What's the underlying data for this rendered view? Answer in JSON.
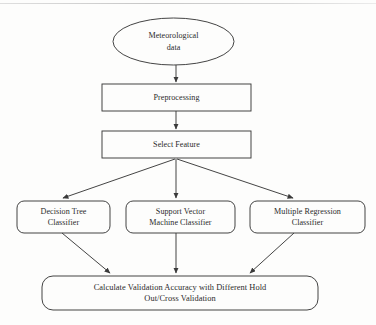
{
  "diagram": {
    "type": "flowchart",
    "background_color": "#fdfdfc",
    "stroke_color": "#3a3a3a",
    "text_color": "#2b2b2b",
    "nodes": [
      {
        "id": "source",
        "shape": "ellipse",
        "lines": [
          "Meteorological",
          "data"
        ]
      },
      {
        "id": "preprocess",
        "shape": "rectangle",
        "lines": [
          "Preprocessing"
        ]
      },
      {
        "id": "select",
        "shape": "rectangle",
        "lines": [
          "Select Feature"
        ]
      },
      {
        "id": "dtree",
        "shape": "rounded-rectangle",
        "lines": [
          "Decision Tree",
          "Classifier"
        ]
      },
      {
        "id": "svm",
        "shape": "rounded-rectangle",
        "lines": [
          "Support Vector",
          "Machine Classifier"
        ]
      },
      {
        "id": "mreg",
        "shape": "rounded-rectangle",
        "lines": [
          "Multiple Regression",
          "Classifier"
        ]
      },
      {
        "id": "validate",
        "shape": "rounded-rectangle",
        "lines": [
          "Calculate Validation Accuracy with Different Hold",
          "Out/Cross Validation"
        ]
      }
    ],
    "edges": [
      {
        "from": "source",
        "to": "preprocess"
      },
      {
        "from": "preprocess",
        "to": "select"
      },
      {
        "from": "select",
        "to": "dtree"
      },
      {
        "from": "select",
        "to": "svm"
      },
      {
        "from": "select",
        "to": "mreg"
      },
      {
        "from": "dtree",
        "to": "validate"
      },
      {
        "from": "svm",
        "to": "validate"
      },
      {
        "from": "mreg",
        "to": "validate"
      }
    ]
  },
  "text": {
    "source_line1": "Meteorological",
    "source_line2": "data",
    "preprocess_line1": "Preprocessing",
    "select_line1": "Select Feature",
    "dtree_line1": "Decision Tree",
    "dtree_line2": "Classifier",
    "svm_line1": "Support Vector",
    "svm_line2": "Machine Classifier",
    "mreg_line1": "Multiple Regression",
    "mreg_line2": "Classifier",
    "validate_line1": "Calculate Validation Accuracy with Different Hold",
    "validate_line2": "Out/Cross Validation"
  }
}
